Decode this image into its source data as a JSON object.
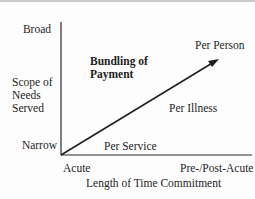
{
  "diagram": {
    "y_axis": {
      "title_lines": [
        "Scope of",
        "Needs",
        "Served"
      ],
      "top_label": "Broad",
      "bottom_label": "Narrow"
    },
    "x_axis": {
      "title": "Length of Time Commitment",
      "left_label": "Acute",
      "right_label": "Pre-/Post-Acute"
    },
    "heading_lines": [
      "Bundling of",
      "Payment"
    ],
    "points": [
      {
        "label": "Per Service"
      },
      {
        "label": "Per Illness"
      },
      {
        "label": "Per Person"
      }
    ],
    "colors": {
      "line": "#1e1e1e",
      "axis": "#2a2a2a",
      "background": "#fdfdfd"
    }
  }
}
